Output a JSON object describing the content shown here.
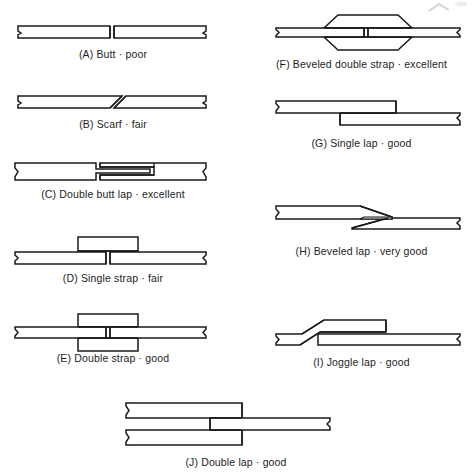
{
  "page": {
    "background_color": "#ffffff",
    "line_color": "#1a1a1a",
    "fill_color": "#ffffff",
    "shade_color": "#d8d8d4",
    "figure_count": 10
  },
  "figures": [
    {
      "id": "A",
      "key": "butt",
      "caption": "(A) Butt · poor",
      "name": "Butt",
      "rating": "poor",
      "column": "left",
      "row": 1
    },
    {
      "id": "B",
      "key": "scarf",
      "caption": "(B) Scarf · fair",
      "name": "Scarf",
      "rating": "fair",
      "column": "left",
      "row": 2
    },
    {
      "id": "C",
      "key": "double-butt-lap",
      "caption": "(C) Double butt lap · excellent",
      "name": "Double butt lap",
      "rating": "excellent",
      "column": "left",
      "row": 3
    },
    {
      "id": "D",
      "key": "single-strap",
      "caption": "(D) Single strap · fair",
      "name": "Single strap",
      "rating": "fair",
      "column": "left",
      "row": 4
    },
    {
      "id": "E",
      "key": "double-strap",
      "caption": "(E) Double strap · good",
      "name": "Double strap",
      "rating": "good",
      "column": "left",
      "row": 5
    },
    {
      "id": "F",
      "key": "beveled-double-strap",
      "caption": "(F) Beveled double strap · excellent",
      "name": "Beveled double strap",
      "rating": "excellent",
      "column": "right",
      "row": 1
    },
    {
      "id": "G",
      "key": "single-lap",
      "caption": "(G) Single lap · good",
      "name": "Single lap",
      "rating": "good",
      "column": "right",
      "row": 2
    },
    {
      "id": "H",
      "key": "beveled-lap",
      "caption": "(H) Beveled lap · very good",
      "name": "Beveled lap",
      "rating": "very good",
      "column": "right",
      "row": 3
    },
    {
      "id": "I",
      "key": "joggle-lap",
      "caption": "(I) Joggle lap · good",
      "name": "Joggle lap",
      "rating": "good",
      "column": "right",
      "row": 4
    },
    {
      "id": "J",
      "key": "double-lap",
      "caption": "(J) Double lap · good",
      "name": "Double lap",
      "rating": "good",
      "column": "bottom",
      "row": 6
    }
  ]
}
